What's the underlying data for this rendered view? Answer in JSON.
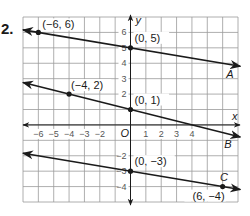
{
  "problem_number": "2.",
  "chart_data": {
    "type": "line",
    "title": "",
    "xlabel": "x",
    "ylabel": "y",
    "xlim": [
      -7,
      7
    ],
    "ylim": [
      -5,
      7
    ],
    "grid": true,
    "x_ticks": [
      "-6",
      "-5",
      "-4",
      "-3",
      "-2",
      "1",
      "2",
      "3",
      "4"
    ],
    "y_ticks": [
      "6",
      "5",
      "4",
      "3",
      "2",
      "-2",
      "-3",
      "-4"
    ],
    "origin_label": "O",
    "series": [
      {
        "name": "A",
        "points": [
          {
            "x": -6,
            "y": 6,
            "label": "(−6, 6)"
          },
          {
            "x": 0,
            "y": 5,
            "label": "(0, 5)"
          }
        ]
      },
      {
        "name": "B",
        "points": [
          {
            "x": -4,
            "y": 2,
            "label": "(−4, 2)"
          },
          {
            "x": 0,
            "y": 1,
            "label": "(0, 1)"
          }
        ]
      },
      {
        "name": "C",
        "points": [
          {
            "x": 0,
            "y": -3,
            "label": "(0, −3)"
          },
          {
            "x": 6,
            "y": -4,
            "label": "(6, −4)"
          }
        ]
      }
    ]
  }
}
